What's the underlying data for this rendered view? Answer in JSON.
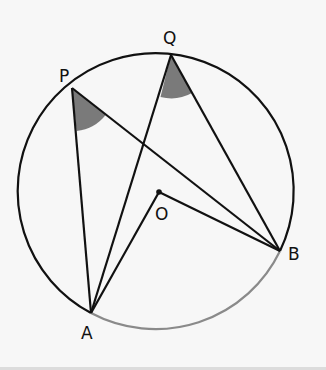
{
  "diagram": {
    "type": "circle-theorem",
    "labels": {
      "P": "P",
      "Q": "Q",
      "O": "O",
      "A": "A",
      "B": "B"
    },
    "colors": {
      "line": "#111111",
      "arc_AB": "#8a8a8a",
      "angle_shade": "#7a7a7a",
      "background": "#f7f7f7"
    },
    "circle": {
      "cx": 158,
      "cy": 193,
      "r": 138
    },
    "points": {
      "P": [
        72,
        88
      ],
      "Q": [
        171,
        55
      ],
      "A": [
        91,
        313
      ],
      "B": [
        280,
        251
      ],
      "O": [
        159,
        192
      ]
    },
    "segments": [
      "PA",
      "PB",
      "QA",
      "QB",
      "OA",
      "OB"
    ],
    "shaded_angles": [
      "APB",
      "AQB"
    ],
    "highlighted_arc": "AB (minor)"
  }
}
